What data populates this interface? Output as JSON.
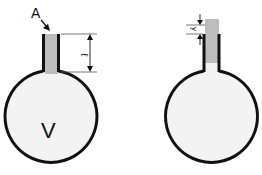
{
  "figure": {
    "left_flask": {
      "label_area": "A",
      "label_length": "ℓ",
      "label_volume": "V"
    },
    "right_flask": {
      "label_displacement": "y"
    }
  },
  "colors": {
    "outline": "#111111",
    "liquid_column": "#bdbdbd",
    "bulb_fill": "#f3f3f3",
    "background": "#ffffff"
  }
}
